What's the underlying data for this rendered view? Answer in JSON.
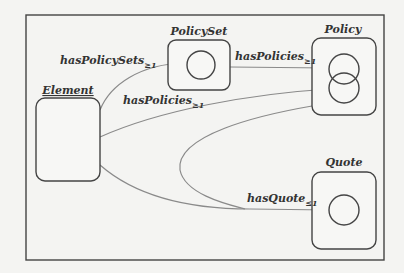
{
  "diagram": {
    "colors": {
      "background": "#f4f4f2",
      "stroke": "#444444",
      "edge": "#8a8a8a",
      "text": "#333333"
    },
    "nodes": {
      "element": {
        "label": "Element",
        "underline": true
      },
      "policy_set": {
        "label": "PolicySet"
      },
      "policy": {
        "label": "Policy"
      },
      "quote": {
        "label": "Quote"
      }
    },
    "edges": [
      {
        "id": "e1",
        "from": "Element",
        "to": "PolicySet",
        "label": "hasPolicySets",
        "sub": "≥1"
      },
      {
        "id": "e2",
        "from": "PolicySet",
        "to": "Policy",
        "label": "hasPolicies",
        "sub": "≥1"
      },
      {
        "id": "e3",
        "from": "Element",
        "to": "Policy",
        "label": "hasPolicies",
        "sub": "≥1"
      },
      {
        "id": "e4",
        "from": "Element",
        "to": "Quote",
        "label": "hasQuote",
        "sub": "≤1"
      },
      {
        "id": "e5",
        "from": "Policy",
        "to": "Quote",
        "label": "",
        "sub": ""
      }
    ]
  }
}
